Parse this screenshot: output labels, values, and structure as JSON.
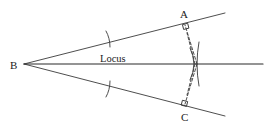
{
  "diagram": {
    "labels": {
      "A": "A",
      "B": "B",
      "C": "C",
      "locus": "Locus"
    },
    "points": {
      "B": [
        24,
        64
      ],
      "A_foot": [
        185,
        25
      ],
      "C_foot": [
        185,
        104
      ],
      "P": [
        197,
        64
      ],
      "upper_ray_end": [
        225,
        13
      ],
      "lower_ray_end": [
        225,
        116
      ],
      "locus_end": [
        263,
        64
      ]
    },
    "colors": {
      "stroke": "#3a3a3a",
      "text": "#222222",
      "background": "#ffffff"
    }
  }
}
